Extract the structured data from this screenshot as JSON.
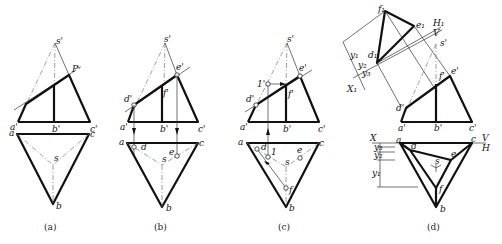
{
  "figure": {
    "panels": [
      {
        "id": "a",
        "caption": "(a)",
        "labels": {
          "s_prime": "s'",
          "plane": "Pᵛ",
          "a_prime": "a'",
          "b_prime": "b'",
          "c_prime": "c'",
          "a": "a",
          "c": "c",
          "s": "s",
          "b": "b"
        }
      },
      {
        "id": "b",
        "caption": "(b)",
        "labels": {
          "s_prime": "s'",
          "e_prime": "e'",
          "d_prime": "d'",
          "f_prime": "f'",
          "a_prime": "a'",
          "b_prime": "b'",
          "c_prime": "c'",
          "a": "a",
          "c": "c",
          "d": "d",
          "e": "e",
          "s": "s",
          "b": "b"
        }
      },
      {
        "id": "c",
        "caption": "(c)",
        "labels": {
          "s_prime": "s'",
          "e_prime": "e'",
          "one_prime": "1'",
          "d_prime": "d'",
          "f_prime": "f'",
          "a_prime": "a'",
          "b_prime": "b'",
          "c_prime": "c'",
          "a": "a",
          "c": "c",
          "d": "d",
          "one": "1",
          "e": "e",
          "s": "s",
          "f": "f",
          "b": "b"
        }
      },
      {
        "id": "d",
        "caption": "(d)",
        "labels": {
          "f1": "f₁",
          "e1": "e₁",
          "d1": "d₁",
          "H1": "H₁",
          "V": "V",
          "y1": "y₁",
          "y2": "y₂",
          "y3": "y₃",
          "X1": "X₁",
          "s_prime": "s'",
          "f_prime": "f'",
          "e_prime": "e'",
          "d_prime": "d'",
          "a_prime": "a'",
          "b_prime": "b'",
          "c_prime": "c'",
          "X": "X",
          "V_axis": "V",
          "H_axis": "H",
          "a": "a",
          "c": "c",
          "d": "d",
          "e": "e",
          "s": "s",
          "f": "f",
          "b": "b",
          "y3_h": "y₃",
          "y2_h": "y₂",
          "y1_h": "y₁"
        }
      }
    ]
  }
}
